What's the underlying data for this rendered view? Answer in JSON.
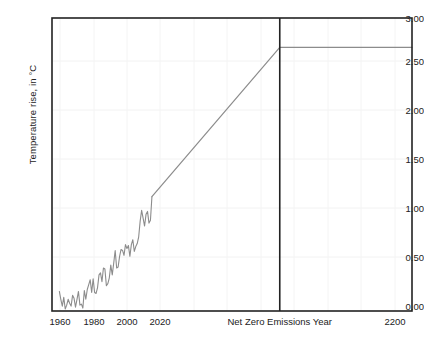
{
  "chart_data": {
    "type": "line",
    "title": "",
    "xlabel": "",
    "ylabel": "Temperature rise, in °C",
    "xlim": [
      1955,
      2200
    ],
    "ylim": [
      0.0,
      3.0
    ],
    "grid": true,
    "legend": null,
    "y_ticks": [
      "0.00",
      "0.50",
      "1.00",
      "1.50",
      "2.00",
      "2.50",
      "3.00"
    ],
    "y_tick_values": [
      0.0,
      0.5,
      1.0,
      1.5,
      2.0,
      2.5,
      3.0
    ],
    "x_ticks": [
      "1960",
      "1980",
      "2000",
      "2020",
      "2200"
    ],
    "x_tick_values": [
      1960,
      1980,
      2000,
      2020,
      2200
    ],
    "annotations": [
      {
        "name": "net-zero-emissions-year",
        "label": "Net Zero Emissions Year",
        "type": "vline",
        "x": 2110,
        "color": "#222222"
      }
    ],
    "series": [
      {
        "name": "historical-temperature",
        "color": "#8c8c8c",
        "x": [
          1960,
          1961,
          1962,
          1963,
          1964,
          1965,
          1966,
          1967,
          1968,
          1969,
          1970,
          1971,
          1972,
          1973,
          1974,
          1975,
          1976,
          1977,
          1978,
          1979,
          1980,
          1981,
          1982,
          1983,
          1984,
          1985,
          1986,
          1987,
          1988,
          1989,
          1990,
          1991,
          1992,
          1993,
          1994,
          1995,
          1996,
          1997,
          1998,
          1999,
          2000,
          2001,
          2002,
          2003,
          2004,
          2005,
          2006,
          2007,
          2008,
          2009,
          2010,
          2011,
          2012,
          2013,
          2014,
          2015,
          2016,
          2017,
          2018,
          2019,
          2020,
          2021,
          2022,
          2023
        ],
        "y": [
          0.2,
          0.12,
          0.05,
          0.14,
          0.02,
          0.06,
          0.12,
          0.08,
          0.05,
          0.16,
          0.13,
          0.04,
          0.12,
          0.2,
          0.06,
          0.07,
          0.03,
          0.21,
          0.12,
          0.22,
          0.27,
          0.32,
          0.19,
          0.33,
          0.19,
          0.18,
          0.24,
          0.37,
          0.39,
          0.3,
          0.44,
          0.43,
          0.26,
          0.28,
          0.34,
          0.47,
          0.37,
          0.49,
          0.62,
          0.44,
          0.45,
          0.56,
          0.63,
          0.62,
          0.57,
          0.68,
          0.64,
          0.67,
          0.56,
          0.68,
          0.73,
          0.61,
          0.66,
          0.69,
          0.76,
          0.92,
          1.03,
          0.95,
          0.87,
          0.99,
          1.02,
          0.9,
          0.93,
          1.17
        ]
      },
      {
        "name": "projected-temperature",
        "color": "#8c8c8c",
        "x": [
          2023,
          2110,
          2200
        ],
        "y": [
          1.17,
          2.7,
          2.7
        ]
      }
    ],
    "plateau_value": 2.7
  }
}
